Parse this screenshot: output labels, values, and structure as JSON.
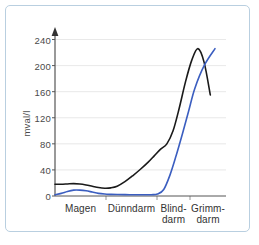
{
  "chart_data": {
    "type": "line",
    "title": "",
    "xlabel": "",
    "ylabel": "mval/l",
    "ylim": [
      0,
      250
    ],
    "yticks": [
      0,
      40,
      80,
      120,
      160,
      200,
      240
    ],
    "ytick_labels": [
      "0",
      "40",
      "80",
      "120",
      "160",
      "200",
      "240"
    ],
    "grid": true,
    "grid_axis": "y",
    "legend": "none",
    "x_segments": [
      {
        "name": "Magen",
        "label_line1": "Magen",
        "label_line2": ""
      },
      {
        "name": "Duenndarm",
        "label_line1": "Dünndarm",
        "label_line2": ""
      },
      {
        "name": "Blinddarm",
        "label_line1": "Blind-",
        "label_line2": "darm"
      },
      {
        "name": "Grimmdarm",
        "label_line1": "Grimm-",
        "label_line2": "darm"
      }
    ],
    "x_axis_arrow": false,
    "y_axis_arrow": true,
    "series": [
      {
        "name": "black-curve",
        "color": "#1a1a1a",
        "width": 1.6,
        "x": [
          0,
          4,
          8,
          12,
          16,
          20,
          24,
          28,
          32,
          36,
          40,
          45,
          50,
          55,
          60,
          64,
          68,
          72,
          76,
          80,
          84,
          88,
          92,
          96,
          100
        ],
        "y": [
          18,
          18,
          18.5,
          19,
          18.5,
          17,
          15,
          13,
          12,
          12.5,
          15,
          22,
          31,
          41,
          52,
          62,
          72,
          80,
          100,
          135,
          175,
          208,
          226,
          205,
          155
        ]
      },
      {
        "name": "blue-curve",
        "color": "#3b5ec0",
        "width": 1.6,
        "x": [
          0,
          4,
          8,
          12,
          16,
          20,
          24,
          28,
          32,
          36,
          40,
          48,
          56,
          62,
          66,
          70,
          74,
          78,
          82,
          86,
          90,
          96,
          103
        ],
        "y": [
          2,
          4,
          7,
          9,
          9,
          8,
          6,
          4,
          3,
          2.5,
          2.2,
          2,
          2,
          2,
          3,
          10,
          32,
          62,
          95,
          130,
          165,
          200,
          226
        ]
      }
    ]
  },
  "axis": {
    "y_title": "mval/l"
  }
}
